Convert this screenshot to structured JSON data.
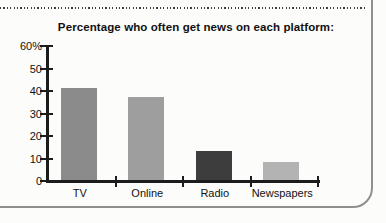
{
  "page": {
    "chart_title": "Percentage who often get news on each platform:"
  },
  "chart_data": {
    "type": "bar",
    "title": "Percentage who often get news on each platform:",
    "categories": [
      "TV",
      "Online",
      "Radio",
      "Newspapers"
    ],
    "values": [
      41,
      37,
      13,
      8
    ],
    "bar_colors": [
      "#8b8b8b",
      "#9e9e9e",
      "#3d3d3d",
      "#b3b3b3"
    ],
    "xlabel": "",
    "ylabel": "",
    "ylim": [
      0,
      60
    ],
    "ytick_step": 10,
    "ytick_labels": [
      "0",
      "10",
      "20",
      "30",
      "40",
      "50",
      "60%"
    ],
    "grid": false,
    "legend": false
  },
  "colors": {
    "axis": "#1c1c1c",
    "card_border": "#8f8f8f",
    "dotted_rule": "#3f3f3f",
    "text": "#111111",
    "background": "#fcfcfa"
  }
}
